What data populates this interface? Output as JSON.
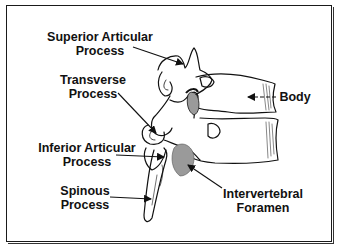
{
  "diagram": {
    "colors": {
      "line": "#111111",
      "foramen_fill": "#9a9a9a",
      "background": "#ffffff"
    },
    "labels": [
      {
        "id": "superior-articular-process",
        "lines": [
          "Superior Articular",
          "Process"
        ]
      },
      {
        "id": "transverse-process",
        "lines": [
          "Transverse",
          "Process"
        ]
      },
      {
        "id": "inferior-articular-process",
        "lines": [
          "Inferior Articular",
          "Process"
        ]
      },
      {
        "id": "spinous-process",
        "lines": [
          "Spinous",
          "Process"
        ]
      },
      {
        "id": "body",
        "lines": [
          "Body"
        ]
      },
      {
        "id": "intervertebral-foramen",
        "lines": [
          "Intervertebral",
          "Foramen"
        ]
      }
    ]
  }
}
